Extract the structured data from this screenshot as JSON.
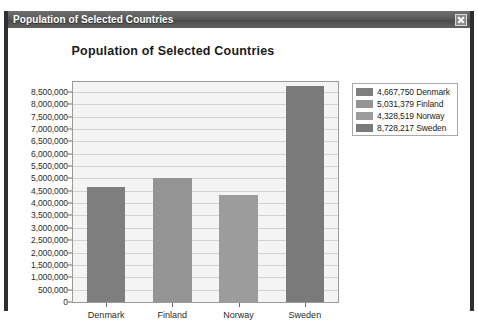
{
  "window": {
    "title": "Population of Selected Countries",
    "close_label": "Close",
    "close_icon": "close-icon",
    "titlebar_color": "#5a5a5a",
    "frame_color": "#2f2f2f"
  },
  "chart_data": {
    "type": "bar",
    "title": "Population of Selected Countries",
    "xlabel": "",
    "ylabel": "",
    "categories": [
      "Denmark",
      "Finland",
      "Norway",
      "Sweden"
    ],
    "values": [
      4667750,
      5031379,
      4328519,
      8728217
    ],
    "series": [
      {
        "name": "Denmark",
        "value": 4667750,
        "value_label": "4,667,750",
        "color": "#7e7e7e"
      },
      {
        "name": "Finland",
        "value": 5031379,
        "value_label": "5,031,379",
        "color": "#949494"
      },
      {
        "name": "Norway",
        "value": 4328519,
        "value_label": "4,328,519",
        "color": "#9c9c9c"
      },
      {
        "name": "Sweden",
        "value": 8728217,
        "value_label": "8,728,217",
        "color": "#7a7a7a"
      }
    ],
    "ylim": [
      0,
      8900000
    ],
    "ytick_values": [
      8500000,
      8000000,
      7500000,
      7000000,
      6500000,
      6000000,
      5500000,
      5000000,
      4500000,
      4000000,
      3500000,
      3000000,
      2500000,
      2000000,
      1500000,
      1000000,
      500000,
      0
    ],
    "ytick_labels": [
      "8,500,000",
      "8,000,000",
      "7,500,000",
      "7,000,000",
      "6,500,000",
      "6,000,000",
      "5,500,000",
      "5,000,000",
      "4,500,000",
      "4,000,000",
      "3,500,000",
      "3,000,000",
      "2,500,000",
      "2,000,000",
      "1,500,000",
      "1,000,000",
      "500,000",
      "0"
    ],
    "grid": true,
    "legend_position": "right",
    "legend_entries": [
      {
        "label": "4,667,750 Denmark",
        "color": "#7e7e7e"
      },
      {
        "label": "5,031,379 Finland",
        "color": "#949494"
      },
      {
        "label": "4,328,519 Norway",
        "color": "#9c9c9c"
      },
      {
        "label": "8,728,217 Sweden",
        "color": "#7a7a7a"
      }
    ],
    "plot_background": "#f4f4f4",
    "gridline_color": "#d2d2d2"
  }
}
